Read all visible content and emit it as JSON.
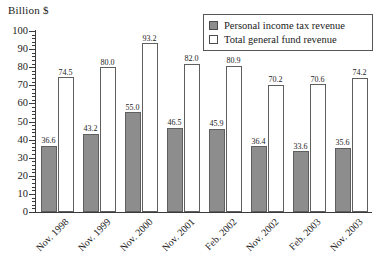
{
  "chart_data": {
    "type": "bar",
    "title": "",
    "ylabel": "Billion $",
    "xlabel": "",
    "ylim": [
      0,
      100
    ],
    "ytick_step": 10,
    "yticks": [
      "0",
      "10",
      "20",
      "30",
      "40",
      "50",
      "60",
      "70",
      "80",
      "90",
      "100"
    ],
    "grid": false,
    "legend_position": "top-right",
    "categories": [
      "Nov. 1998",
      "Nov. 1999",
      "Nov. 2000",
      "Nov. 2001",
      "Feb. 2002",
      "Nov. 2002",
      "Feb. 2003",
      "Nov. 2003"
    ],
    "series": [
      {
        "name": "Personal income tax revenue",
        "color": "#8d8d8d",
        "values": [
          36.6,
          43.2,
          55.0,
          46.5,
          45.9,
          36.4,
          33.6,
          35.6
        ],
        "labels": [
          "36.6",
          "43.2",
          "55.0",
          "46.5",
          "45.9",
          "36.4",
          "33.6",
          "35.6"
        ]
      },
      {
        "name": "Total general fund revenue",
        "color": "#ffffff",
        "values": [
          74.5,
          80.0,
          93.2,
          82.0,
          80.9,
          70.2,
          70.6,
          74.2
        ],
        "labels": [
          "74.5",
          "80.0",
          "93.2",
          "82.0",
          "80.9",
          "70.2",
          "70.6",
          "74.2"
        ]
      }
    ]
  },
  "legend": {
    "items": [
      {
        "label": "Personal income tax revenue",
        "swatch": "filled"
      },
      {
        "label": "Total general fund revenue",
        "swatch": "hollow"
      }
    ]
  }
}
